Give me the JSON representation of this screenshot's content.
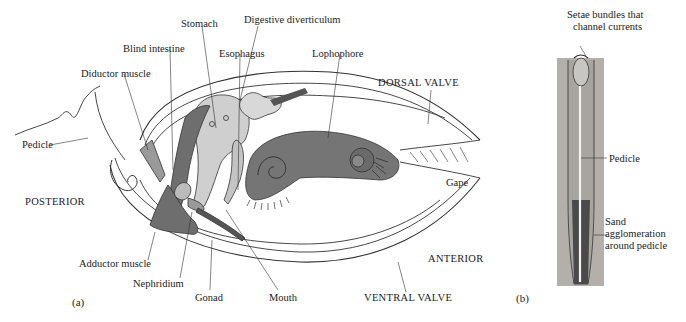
{
  "figure": {
    "panel_a": {
      "panel_label": "(a)",
      "labels": {
        "stomach": "Stomach",
        "digestive_diverticulum": "Digestive diverticulum",
        "blind_intestine": "Blind intestine",
        "esophagus": "Esophagus",
        "lophophore": "Lophophore",
        "diductor_muscle": "Diductor muscle",
        "dorsal_valve": "DORSAL VALVE",
        "pedicle": "Pedicle",
        "gape": "Gape",
        "posterior": "POSTERIOR",
        "adductor_muscle": "Adductor muscle",
        "nephridium": "Nephridium",
        "anterior": "ANTERIOR",
        "gonad": "Gonad",
        "mouth": "Mouth",
        "ventral_valve": "VENTRAL VALVE"
      }
    },
    "panel_b": {
      "panel_label": "(b)",
      "labels": {
        "setae_line1": "Setae bundles that",
        "setae_line2": "channel currents",
        "pedicle": "Pedicle",
        "sand_line1": "Sand",
        "sand_line2": "agglomeration",
        "sand_line3": "around pedicle"
      }
    },
    "colors": {
      "dark_organ": "#6e6e6e",
      "mid_organ": "#8a8a8a",
      "light_organ": "#cfcfcf",
      "sediment": "#b3b0ac",
      "line": "#333333"
    }
  }
}
